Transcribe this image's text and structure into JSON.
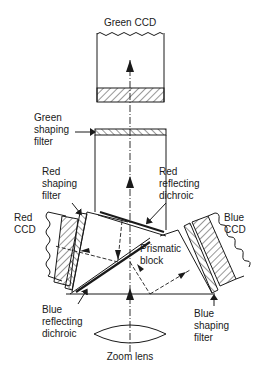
{
  "diagram": {
    "labels": {
      "green_ccd": "Green CCD",
      "green_shaping_filter": [
        "Green",
        "shaping",
        "filter"
      ],
      "red_shaping_filter": [
        "Red",
        "shaping",
        "filter"
      ],
      "red_reflecting_dichroic": [
        "Red",
        "reflecting",
        "dichroic"
      ],
      "red_ccd": [
        "Red",
        "CCD"
      ],
      "blue_ccd": [
        "Blue",
        "CCD"
      ],
      "prismatic_block": [
        "Prismatic",
        "block"
      ],
      "blue_reflecting_dichroic": [
        "Blue",
        "reflecting",
        "dichroic"
      ],
      "blue_shaping_filter": [
        "Blue",
        "shaping",
        "filter"
      ],
      "zoom_lens": "Zoom lens"
    },
    "colors": {
      "ink": "#1a1a1a",
      "background": "#ffffff"
    }
  }
}
